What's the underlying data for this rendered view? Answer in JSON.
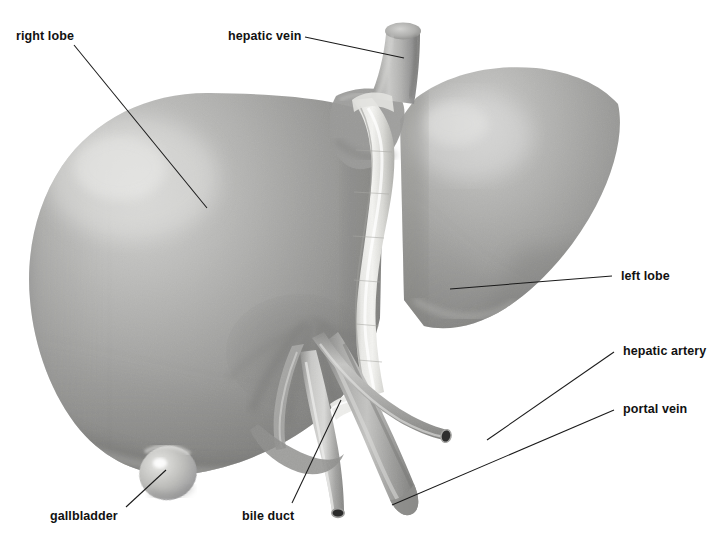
{
  "figure": {
    "view": "anterior",
    "background_color": "#ffffff",
    "style": "grayscale airbrush anatomical illustration",
    "label_color": "#111111",
    "leader_line_color": "#1a1a1a"
  },
  "labels": [
    {
      "id": "right-lobe",
      "text": "right lobe",
      "x": 16,
      "y": 30,
      "align": "left",
      "leader": {
        "from": [
          74,
          45
        ],
        "to": [
          207,
          208
        ]
      }
    },
    {
      "id": "hepatic-vein",
      "text": "hepatic vein",
      "x": 228,
      "y": 30,
      "align": "left",
      "leader": {
        "from": [
          305,
          37
        ],
        "to": [
          404,
          58
        ]
      }
    },
    {
      "id": "left-lobe",
      "text": "left lobe",
      "x": 621,
      "y": 270,
      "align": "left",
      "leader": {
        "from": [
          612,
          276
        ],
        "to": [
          450,
          289
        ]
      }
    },
    {
      "id": "hepatic-artery",
      "text": "hepatic artery",
      "x": 623,
      "y": 345,
      "align": "left",
      "leader": {
        "from": [
          614,
          352
        ],
        "to": [
          487,
          440
        ]
      }
    },
    {
      "id": "portal-vein",
      "text": "portal vein",
      "x": 623,
      "y": 403,
      "align": "left",
      "leader": {
        "from": [
          614,
          410
        ],
        "to": [
          392,
          505
        ]
      }
    },
    {
      "id": "gallbladder",
      "text": "gallbladder",
      "x": 50,
      "y": 510,
      "align": "left",
      "leader": {
        "from": [
          126,
          507
        ],
        "to": [
          166,
          470
        ]
      }
    },
    {
      "id": "bile-duct",
      "text": "bile duct",
      "x": 242,
      "y": 510,
      "align": "left",
      "leader": {
        "from": [
          292,
          503
        ],
        "to": [
          341,
          400
        ]
      }
    }
  ],
  "structures": [
    {
      "id": "right-lobe",
      "name": "right lobe",
      "tone": "#9b9b9b"
    },
    {
      "id": "left-lobe",
      "name": "left lobe",
      "tone": "#a2a2a2"
    },
    {
      "id": "falciform-ligament",
      "name": "falciform ligament",
      "tone": "#e3e3e1"
    },
    {
      "id": "hepatic-vein",
      "name": "hepatic vein",
      "tone": "#a8a8a8"
    },
    {
      "id": "gallbladder",
      "name": "gallbladder",
      "tone": "#c9c9c7"
    },
    {
      "id": "bile-duct",
      "name": "bile duct",
      "tone": "#b4b4b2"
    },
    {
      "id": "portal-vein",
      "name": "portal vein",
      "tone": "#9f9f9d"
    },
    {
      "id": "hepatic-artery",
      "name": "hepatic artery",
      "tone": "#b0b0ae"
    }
  ]
}
